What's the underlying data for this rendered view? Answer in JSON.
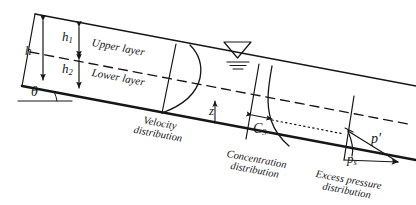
{
  "figure": {
    "type": "engineering-diagram",
    "labels": {
      "total_depth": "h",
      "upper_depth": "h",
      "upper_depth_sub": "1",
      "lower_depth": "h",
      "lower_depth_sub": "2",
      "slope_angle": "θ",
      "upper_layer": "Upper layer",
      "lower_layer": "Lower layer",
      "elevation": "z",
      "concentration": "C",
      "concentration_sub": "3",
      "excess_pressure_prime": "p′",
      "static_pressure": "p",
      "static_pressure_sub": "s"
    },
    "captions": {
      "velocity": [
        "Velocity",
        "distribution"
      ],
      "concentration": [
        "Concentration",
        "distribution"
      ],
      "pressure": [
        "Excess pressure",
        "distribution"
      ]
    },
    "colors": {
      "ink": "#161616",
      "bed": "#1a1a1a"
    }
  }
}
